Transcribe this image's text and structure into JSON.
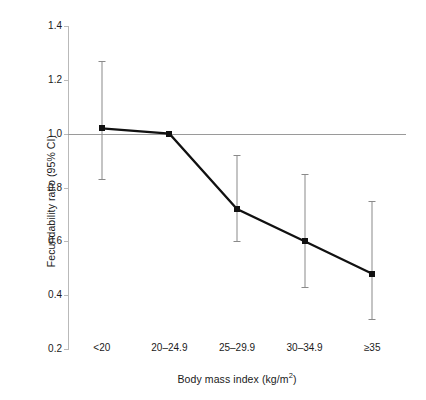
{
  "chart_data": {
    "type": "line",
    "title": "",
    "xlabel": "Body mass index (kg/m2)",
    "xlabel_prefix": "Body mass index (kg/m",
    "xlabel_exponent": "2",
    "xlabel_suffix": ")",
    "ylabel": "Fecundability ratio (95% CI)",
    "categories": [
      "<20",
      "20–24.9",
      "25–29.9",
      "30–34.9",
      "≥35"
    ],
    "values": [
      1.02,
      1.0,
      0.72,
      0.6,
      0.48
    ],
    "ci_lower": [
      0.83,
      null,
      0.6,
      0.43,
      0.31
    ],
    "ci_upper": [
      1.27,
      null,
      0.92,
      0.85,
      0.75
    ],
    "ylim": [
      0.2,
      1.4
    ],
    "yticks": [
      "1.4",
      "1.2",
      "1.0",
      "0.8",
      "0.6",
      "0.4",
      "0.2"
    ],
    "ytick_values": [
      1.4,
      1.2,
      1.0,
      0.8,
      0.6,
      0.4,
      0.2
    ],
    "reference_line": 1.0,
    "grid": false,
    "legend": "none",
    "marker_color": "#111111",
    "line_color": "#111111",
    "errorbar_color": "#8a8a8a",
    "reference_line_color": "#9a9a9a",
    "axis_color": "#b9b9b9",
    "background_color": "#ffffff"
  }
}
